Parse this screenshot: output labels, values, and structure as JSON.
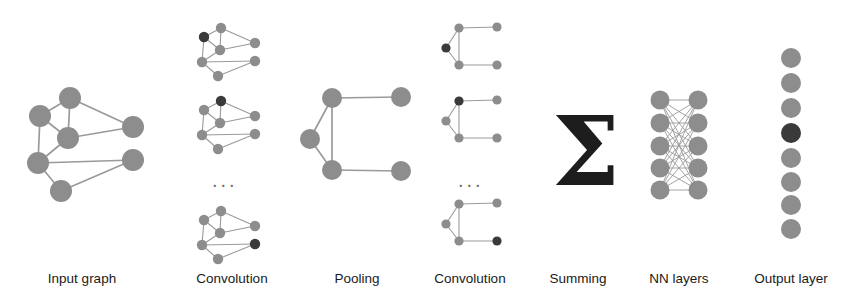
{
  "figure": {
    "type": "diagram",
    "width": 862,
    "height": 298,
    "background": "#ffffff"
  },
  "colors": {
    "node": "#8d8d8d",
    "node_highlight": "#3a3a3a",
    "edge": "#9a9a9a",
    "text": "#1a1a1a",
    "sigma": "#1d1d1d"
  },
  "captions": [
    {
      "id": "input-graph",
      "label": "Input graph",
      "x": 82,
      "y": 272
    },
    {
      "id": "convolution-1",
      "label": "Convolution",
      "x": 232,
      "y": 272
    },
    {
      "id": "pooling",
      "label": "Pooling",
      "x": 357,
      "y": 272
    },
    {
      "id": "convolution-2",
      "label": "Convolution",
      "x": 470,
      "y": 272
    },
    {
      "id": "summing",
      "label": "Summing",
      "x": 578,
      "y": 272
    },
    {
      "id": "nn-layers",
      "label": "NN layers",
      "x": 679,
      "y": 272
    },
    {
      "id": "output-layer",
      "label": "Output layer",
      "x": 791,
      "y": 272
    }
  ],
  "ellipses": [
    {
      "id": "conv1-ellipsis",
      "label": "...",
      "x": 212,
      "y": 170
    },
    {
      "id": "conv2-ellipsis",
      "label": "...",
      "x": 458,
      "y": 170
    }
  ],
  "summing_symbol": {
    "glyph": "Σ",
    "x": 552,
    "y": 104,
    "size": 96
  },
  "stages": {
    "input_graph": {
      "name": "Input graph",
      "node_radius": 11,
      "nodes": [
        {
          "id": "n1",
          "x": 70,
          "y": 98,
          "dark": false
        },
        {
          "id": "n2",
          "x": 40,
          "y": 116,
          "dark": false
        },
        {
          "id": "n3",
          "x": 68,
          "y": 138,
          "dark": false
        },
        {
          "id": "n4",
          "x": 133,
          "y": 127,
          "dark": false
        },
        {
          "id": "n5",
          "x": 38,
          "y": 163,
          "dark": false
        },
        {
          "id": "n6",
          "x": 133,
          "y": 160,
          "dark": false
        },
        {
          "id": "n7",
          "x": 61,
          "y": 191,
          "dark": false
        }
      ],
      "edges": [
        [
          "n1",
          "n2"
        ],
        [
          "n1",
          "n3"
        ],
        [
          "n1",
          "n4"
        ],
        [
          "n2",
          "n3"
        ],
        [
          "n2",
          "n5"
        ],
        [
          "n3",
          "n4"
        ],
        [
          "n3",
          "n5"
        ],
        [
          "n5",
          "n6"
        ],
        [
          "n5",
          "n7"
        ],
        [
          "n6",
          "n7"
        ]
      ]
    },
    "convolution_1": {
      "name": "Convolution",
      "node_radius": 5.2,
      "graphs": [
        {
          "id": "conv1-g1",
          "ox": 196,
          "oy": 22,
          "highlight": "n2"
        },
        {
          "id": "conv1-g2",
          "ox": 196,
          "oy": 95,
          "highlight": "n1"
        },
        {
          "id": "conv1-g3",
          "ox": 196,
          "oy": 205,
          "highlight": "n6"
        }
      ],
      "template": {
        "nodes": [
          {
            "id": "n1",
            "x": 25,
            "y": 6
          },
          {
            "id": "n2",
            "x": 8,
            "y": 15
          },
          {
            "id": "n3",
            "x": 24,
            "y": 28
          },
          {
            "id": "n4",
            "x": 59,
            "y": 21
          },
          {
            "id": "n5",
            "x": 6,
            "y": 40
          },
          {
            "id": "n6",
            "x": 59,
            "y": 39
          },
          {
            "id": "n7",
            "x": 22,
            "y": 54
          }
        ],
        "edges": [
          [
            "n1",
            "n2"
          ],
          [
            "n1",
            "n3"
          ],
          [
            "n1",
            "n4"
          ],
          [
            "n2",
            "n3"
          ],
          [
            "n2",
            "n5"
          ],
          [
            "n3",
            "n4"
          ],
          [
            "n3",
            "n5"
          ],
          [
            "n5",
            "n6"
          ],
          [
            "n5",
            "n7"
          ],
          [
            "n6",
            "n7"
          ]
        ]
      }
    },
    "pooling": {
      "name": "Pooling",
      "node_radius": 10,
      "nodes": [
        {
          "id": "p1",
          "x": 332,
          "y": 98,
          "dark": false
        },
        {
          "id": "p2",
          "x": 401,
          "y": 97,
          "dark": false
        },
        {
          "id": "p3",
          "x": 310,
          "y": 139,
          "dark": false
        },
        {
          "id": "p4",
          "x": 332,
          "y": 170,
          "dark": false
        },
        {
          "id": "p5",
          "x": 401,
          "y": 171,
          "dark": false
        }
      ],
      "edges": [
        [
          "p1",
          "p2"
        ],
        [
          "p1",
          "p3"
        ],
        [
          "p1",
          "p4"
        ],
        [
          "p3",
          "p4"
        ],
        [
          "p4",
          "p5"
        ]
      ]
    },
    "convolution_2": {
      "name": "Convolution",
      "node_radius": 4.6,
      "graphs": [
        {
          "id": "conv2-g1",
          "ox": 444,
          "oy": 24,
          "highlight": "p3"
        },
        {
          "id": "conv2-g2",
          "ox": 444,
          "oy": 97,
          "highlight": "p1"
        },
        {
          "id": "conv2-g3",
          "ox": 444,
          "oy": 200,
          "highlight": "p5"
        }
      ],
      "template": {
        "nodes": [
          {
            "id": "p1",
            "x": 15,
            "y": 4
          },
          {
            "id": "p2",
            "x": 53,
            "y": 3
          },
          {
            "id": "p3",
            "x": 2,
            "y": 24
          },
          {
            "id": "p4",
            "x": 15,
            "y": 41
          },
          {
            "id": "p5",
            "x": 53,
            "y": 41
          }
        ],
        "edges": [
          [
            "p1",
            "p2"
          ],
          [
            "p1",
            "p3"
          ],
          [
            "p1",
            "p4"
          ],
          [
            "p3",
            "p4"
          ],
          [
            "p4",
            "p5"
          ]
        ]
      }
    },
    "nn_layers": {
      "name": "NN layers",
      "node_radius": 9.5,
      "columns_x": [
        660,
        698
      ],
      "rows_y": [
        100,
        123,
        146,
        168,
        190
      ],
      "fully_connected": true
    },
    "output_layer": {
      "name": "Output layer",
      "node_radius": 10,
      "x": 791,
      "nodes": [
        {
          "id": "o1",
          "y": 58,
          "dark": false
        },
        {
          "id": "o2",
          "y": 83,
          "dark": false
        },
        {
          "id": "o3",
          "y": 108,
          "dark": false
        },
        {
          "id": "o4",
          "y": 133,
          "dark": true
        },
        {
          "id": "o5",
          "y": 158,
          "dark": false
        },
        {
          "id": "o6",
          "y": 182,
          "dark": false
        },
        {
          "id": "o7",
          "y": 205,
          "dark": false
        },
        {
          "id": "o8",
          "y": 229,
          "dark": false
        }
      ]
    }
  }
}
